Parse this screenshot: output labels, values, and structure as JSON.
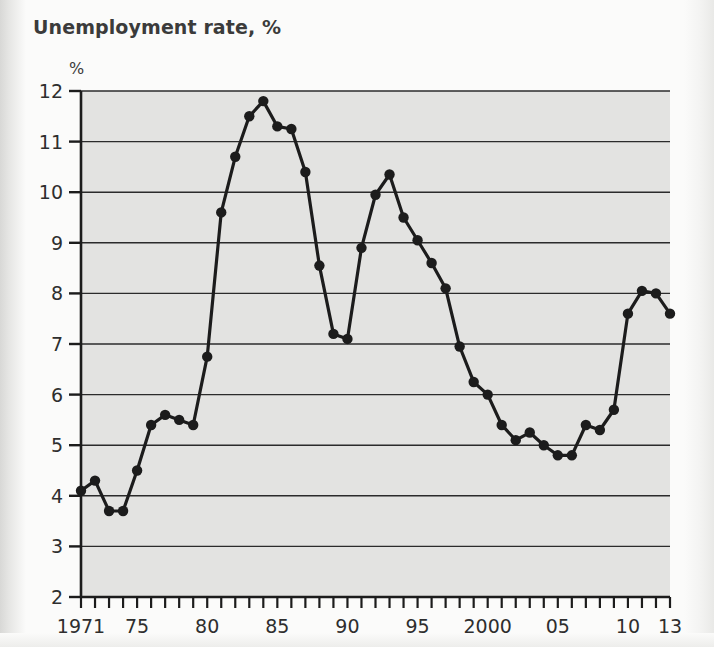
{
  "title": "Unemployment rate, %",
  "chart_data": {
    "type": "line",
    "title": "Unemployment rate, %",
    "xlabel": "",
    "ylabel": "%",
    "y_axis_unit_label": "%",
    "xlim": [
      1971,
      2013
    ],
    "ylim": [
      2,
      12
    ],
    "y_ticks": [
      2,
      3,
      4,
      5,
      6,
      7,
      8,
      9,
      10,
      11,
      12
    ],
    "y_tick_labels": [
      "2",
      "3",
      "4",
      "5",
      "6",
      "7",
      "8",
      "9",
      "10",
      "11",
      "12"
    ],
    "x_ticks": [
      1971,
      1975,
      1980,
      1985,
      1990,
      1995,
      2000,
      2005,
      2010,
      2013
    ],
    "x_tick_labels": [
      "1971",
      "75",
      "80",
      "85",
      "90",
      "95",
      "2000",
      "05",
      "10",
      "13"
    ],
    "x_minor_tick_interval": 1,
    "grid": "horizontal",
    "legend": "none",
    "markers": "filled-circle",
    "line_color": "#1c1c1c",
    "marker_color": "#1c1c1c",
    "plot_background": "#e3e3e1",
    "x": [
      1971,
      1972,
      1973,
      1974,
      1975,
      1976,
      1977,
      1978,
      1979,
      1980,
      1981,
      1982,
      1983,
      1984,
      1985,
      1986,
      1987,
      1988,
      1989,
      1990,
      1991,
      1992,
      1993,
      1994,
      1995,
      1996,
      1997,
      1998,
      1999,
      2000,
      2001,
      2002,
      2003,
      2004,
      2005,
      2006,
      2007,
      2008,
      2009,
      2010,
      2011,
      2012,
      2013
    ],
    "values": [
      4.1,
      4.3,
      3.7,
      3.7,
      4.5,
      5.4,
      5.6,
      5.5,
      5.4,
      6.75,
      9.6,
      10.7,
      11.5,
      11.8,
      11.3,
      11.25,
      10.4,
      8.55,
      7.2,
      7.1,
      8.9,
      9.95,
      10.35,
      9.5,
      9.05,
      8.6,
      8.1,
      6.95,
      6.25,
      6.0,
      5.4,
      5.1,
      5.25,
      5.0,
      4.8,
      4.8,
      5.4,
      5.3,
      5.7,
      7.6,
      8.05,
      8.0,
      7.6
    ]
  },
  "series_name": "Unemployment rate"
}
